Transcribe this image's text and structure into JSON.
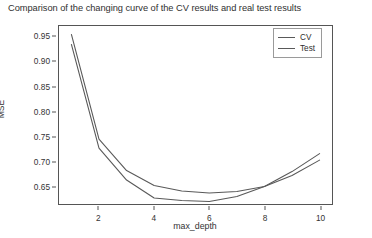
{
  "chart_data": {
    "type": "line",
    "title": "Comparison of the changing curve of the CV results and real test results",
    "xlabel": "max_depth",
    "ylabel": "MSE",
    "x": [
      1,
      2,
      3,
      4,
      5,
      6,
      7,
      8,
      9,
      10
    ],
    "xlim": [
      0.55,
      10.45
    ],
    "ylim": [
      0.615,
      0.972
    ],
    "xticks": [
      2,
      4,
      6,
      8,
      10
    ],
    "xtick_labels": [
      "2",
      "4",
      "6",
      "8",
      "10"
    ],
    "yticks": [
      0.65,
      0.7,
      0.75,
      0.8,
      0.85,
      0.9,
      0.95
    ],
    "ytick_labels": [
      "0.65",
      "0.70",
      "0.75",
      "0.80",
      "0.85",
      "0.90",
      "0.95"
    ],
    "grid": false,
    "legend_position": "upper right",
    "series": [
      {
        "name": "CV",
        "color": "#595959",
        "values": [
          0.955,
          0.745,
          0.682,
          0.652,
          0.641,
          0.637,
          0.64,
          0.65,
          0.672,
          0.703
        ]
      },
      {
        "name": "Test",
        "color": "#595959",
        "values": [
          0.935,
          0.727,
          0.663,
          0.627,
          0.622,
          0.62,
          0.63,
          0.65,
          0.68,
          0.716
        ]
      }
    ]
  },
  "legend": {
    "items": [
      {
        "label": "CV"
      },
      {
        "label": "Test"
      }
    ]
  },
  "colors": {
    "line": "#595959",
    "axis": "#555555",
    "text": "#303030",
    "background": "#ffffff"
  }
}
